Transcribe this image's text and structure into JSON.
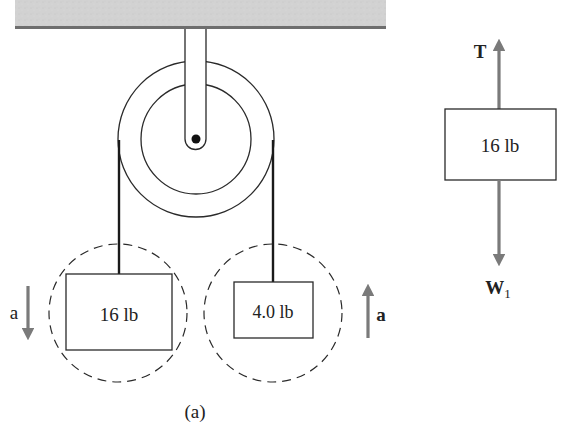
{
  "figure": {
    "caption": "(a)",
    "colors": {
      "ceiling_fill": "#cfcfcf",
      "ceiling_edge": "#6e6e6e",
      "line": "#2a2a2a",
      "force_arrow": "#7a7a7a",
      "background": "#ffffff"
    }
  },
  "system": {
    "left_block": {
      "label": "16 lb"
    },
    "right_block": {
      "label": "4.0 lb"
    },
    "left_accel_label": "a",
    "right_accel_label": "a"
  },
  "free_body": {
    "block_label": "16 lb",
    "tension_label": "T",
    "weight_label": "W",
    "weight_subscript": "1"
  }
}
